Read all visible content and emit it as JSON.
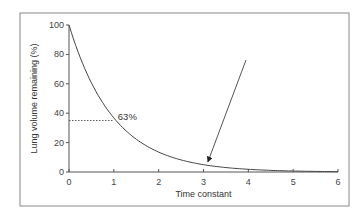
{
  "chart_data": {
    "type": "line",
    "title": "",
    "xlabel": "Time constant",
    "ylabel": "Lung volume remaining (%)",
    "xlim": [
      0,
      6
    ],
    "ylim": [
      0,
      100
    ],
    "x_ticks": [
      0,
      1,
      2,
      3,
      4,
      5,
      6
    ],
    "y_ticks": [
      0,
      20,
      40,
      60,
      80,
      100
    ],
    "grid": false,
    "legend": null,
    "series": [
      {
        "name": "Lung volume remaining",
        "function": "100*exp(-t)",
        "x": [
          0,
          0.5,
          1,
          1.5,
          2,
          2.5,
          3,
          3.5,
          4,
          4.5,
          5,
          5.5,
          6
        ],
        "values": [
          100,
          60.7,
          36.8,
          22.3,
          13.5,
          8.2,
          5.0,
          3.0,
          1.8,
          1.1,
          0.7,
          0.4,
          0.2
        ]
      }
    ],
    "annotations": [
      {
        "type": "dotted-line",
        "y": 35,
        "x_from": 0,
        "x_to": 1,
        "label": "63%"
      },
      {
        "type": "arrow",
        "points_to_x": 3.1,
        "points_to_y": 5
      }
    ]
  },
  "labels": {
    "annotation_63": "63%"
  }
}
